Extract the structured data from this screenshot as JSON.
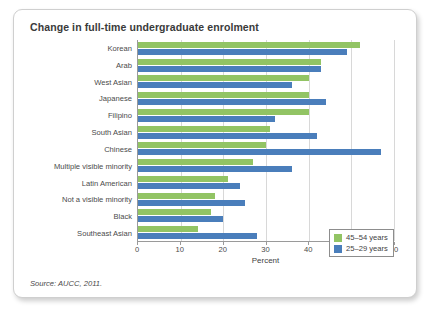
{
  "chart_data": {
    "type": "bar",
    "orientation": "horizontal",
    "title": "Change in full-time undergraduate enrolment",
    "xlabel": "Percent",
    "ylabel": "",
    "xlim": [
      0,
      60
    ],
    "xticks": [
      0,
      10,
      20,
      30,
      40,
      50,
      60
    ],
    "grid": true,
    "legend_position": "inside-right",
    "categories": [
      "Korean",
      "Arab",
      "West Asian",
      "Japanese",
      "Filipino",
      "South Asian",
      "Chinese",
      "Multiple visible minority",
      "Latin American",
      "Not a visible minority",
      "Black",
      "Southeast Asian"
    ],
    "series": [
      {
        "name": "45–54 years",
        "color": "#92c464",
        "values": [
          52,
          43,
          40,
          40,
          40,
          31,
          30,
          27,
          21,
          18,
          17,
          14
        ]
      },
      {
        "name": "25–29 years",
        "color": "#4a7ebb",
        "values": [
          49,
          43,
          36,
          44,
          32,
          42,
          57,
          36,
          24,
          25,
          20,
          28
        ]
      }
    ],
    "source": "Source: AUCC, 2011."
  },
  "legend": {
    "items": [
      {
        "label": "45–54 years",
        "color": "#92c464"
      },
      {
        "label": "25–29 years",
        "color": "#4a7ebb"
      }
    ]
  }
}
